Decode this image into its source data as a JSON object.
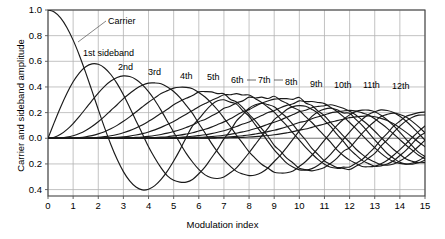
{
  "chart_data": {
    "type": "line",
    "title": "",
    "xlabel": "Modulation index",
    "ylabel": "Carrier and sideband amplitude",
    "xlim": [
      0,
      15
    ],
    "ylim": [
      -0.45,
      1.0
    ],
    "grid": true,
    "legend_position": "inline-annotations",
    "xticks": [
      "0",
      "1",
      "2",
      "3",
      "4",
      "5",
      "6",
      "7",
      "8",
      "9",
      "10",
      "11",
      "12",
      "13",
      "14",
      "15"
    ],
    "xtick_values": [
      0,
      1,
      2,
      3,
      4,
      5,
      6,
      7,
      8,
      9,
      10,
      11,
      12,
      13,
      14,
      15
    ],
    "yticks": [
      "1.0",
      "0.8",
      "0.6",
      "0.4",
      "0.2",
      "0.0",
      "0.2",
      "0.4"
    ],
    "ytick_values": [
      1.0,
      0.8,
      0.6,
      0.4,
      0.2,
      0.0,
      -0.2,
      -0.4
    ],
    "x": [
      0,
      0.25,
      0.5,
      0.75,
      1,
      1.25,
      1.5,
      1.75,
      2,
      2.25,
      2.5,
      2.75,
      3,
      3.25,
      3.5,
      3.75,
      4,
      4.25,
      4.5,
      4.75,
      5,
      5.25,
      5.5,
      5.75,
      6,
      6.25,
      6.5,
      6.75,
      7,
      7.25,
      7.5,
      7.75,
      8,
      8.25,
      8.5,
      8.75,
      9,
      9.25,
      9.5,
      9.75,
      10,
      10.25,
      10.5,
      10.75,
      11,
      11.25,
      11.5,
      11.75,
      12,
      12.25,
      12.5,
      12.75,
      13,
      13.25,
      13.5,
      13.75,
      14,
      14.25,
      14.5,
      14.75,
      15
    ],
    "series": [
      {
        "name": "Carrier",
        "order": 0,
        "label": "Carrier",
        "peak_value": 1.0,
        "first_zero": 2.405,
        "values": [
          1.0,
          0.9844,
          0.9385,
          0.8642,
          0.7652,
          0.6459,
          0.5118,
          0.369,
          0.2239,
          0.0827,
          -0.0484,
          -0.1641,
          -0.2601,
          -0.3325,
          -0.3801,
          -0.4026,
          -0.3971,
          -0.3691,
          -0.3205,
          -0.2561,
          -0.1776,
          -0.0903,
          0.0068,
          0.0963,
          0.1506,
          0.2095,
          0.2601,
          0.2921,
          0.3001,
          0.2818,
          0.2663,
          0.2148,
          0.1717,
          0.1043,
          0.0419,
          -0.0245,
          -0.0903,
          -0.1424,
          -0.1939,
          -0.2243,
          -0.2459,
          -0.2484,
          -0.2366,
          -0.2098,
          -0.1712,
          -0.1229,
          -0.0677,
          -0.0092,
          0.0477,
          0.1025,
          0.1469,
          0.1855,
          0.2069,
          0.2212,
          0.2163,
          0.2012,
          0.1711,
          0.1331,
          0.0875,
          0.0364,
          -0.0142
        ]
      },
      {
        "name": "1st sideband",
        "order": 1,
        "label": "1st sideband",
        "peak_value": 0.582,
        "peak_at": 1.841,
        "values": [
          0,
          0.124,
          0.2423,
          0.3492,
          0.4401,
          0.5106,
          0.5579,
          0.5802,
          0.5767,
          0.5484,
          0.4971,
          0.4258,
          0.3391,
          0.2404,
          0.1374,
          0.0366,
          -0.066,
          -0.1538,
          -0.2311,
          -0.2935,
          -0.3276,
          -0.3414,
          -0.3414,
          -0.321,
          -0.2767,
          -0.2232,
          -0.1538,
          -0.0845,
          -0.0047,
          0.0574,
          0.1352,
          0.184,
          0.2346,
          0.2607,
          0.2731,
          0.2622,
          0.2453,
          0.2031,
          0.1613,
          0.1061,
          0.0435,
          -0.0134,
          -0.0789,
          -0.1275,
          -0.1768,
          -0.2039,
          -0.2284,
          -0.2254,
          -0.2234,
          -0.1951,
          -0.1655,
          -0.1192,
          -0.0703,
          -0.0109,
          0.038,
          0.0946,
          0.1334,
          0.1711,
          0.1864,
          0.2001,
          0.2051
        ]
      },
      {
        "name": "2nd",
        "order": 2,
        "label": "2nd",
        "peak_value": 0.486,
        "peak_at": 3.054,
        "values": [
          0,
          0.0078,
          0.0306,
          0.0673,
          0.1149,
          0.1711,
          0.2321,
          0.294,
          0.3528,
          0.4051,
          0.4461,
          0.4739,
          0.4861,
          0.4813,
          0.4586,
          0.4189,
          0.3641,
          0.2964,
          0.2178,
          0.1331,
          0.0466,
          -0.0374,
          -0.1173,
          -0.185,
          -0.2429,
          -0.2854,
          -0.3074,
          -0.3132,
          -0.3014,
          -0.2694,
          -0.2303,
          -0.1735,
          -0.113,
          -0.0479,
          0.0163,
          0.077,
          0.1448,
          0.1824,
          0.225,
          0.2468,
          0.2546,
          0.2492,
          0.2253,
          0.1933,
          0.139,
          0.0902,
          0.0307,
          -0.0243,
          -0.0849,
          -0.1294,
          -0.1725,
          -0.1977,
          -0.2177,
          -0.2152,
          -0.201,
          -0.1759,
          -0.1345,
          -0.092,
          -0.0396,
          0.0119,
          0.0416
        ]
      },
      {
        "name": "3rd",
        "order": 3,
        "label": "3rd",
        "peak_value": 0.434,
        "peak_at": 4.201,
        "values": [
          0,
          0.0003,
          0.0026,
          0.0086,
          0.0196,
          0.0369,
          0.061,
          0.0921,
          0.1289,
          0.1707,
          0.2166,
          0.2617,
          0.3091,
          0.3492,
          0.3868,
          0.4139,
          0.4302,
          0.4314,
          0.4247,
          0.4002,
          0.3648,
          0.3171,
          0.2561,
          0.1944,
          0.1148,
          0.0416,
          -0.038,
          -0.1072,
          -0.1676,
          -0.2172,
          -0.2581,
          -0.279,
          -0.2911,
          -0.2866,
          -0.2663,
          -0.2314,
          -0.1809,
          -0.1309,
          -0.0701,
          -0.0066,
          0.0583,
          0.116,
          0.1708,
          0.2075,
          0.2273,
          0.2345,
          0.2224,
          0.1977,
          0.1951,
          0.1473,
          0.1013,
          0.044,
          -0.0118,
          -0.0664,
          -0.1186,
          -0.1563,
          -0.1872,
          -0.2011,
          -0.201,
          -0.1905,
          -0.1702
        ]
      },
      {
        "name": "4th",
        "order": 4,
        "label": "4th",
        "peak_value": 0.4,
        "peak_at": 5.318,
        "values": [
          0,
          1e-05,
          0.00016,
          0.0008,
          0.0025,
          0.0059,
          0.0118,
          0.0209,
          0.034,
          0.0513,
          0.0738,
          0.1006,
          0.132,
          0.1671,
          0.2044,
          0.2435,
          0.2811,
          0.3149,
          0.3484,
          0.3713,
          0.3912,
          0.3979,
          0.3967,
          0.3863,
          0.3576,
          0.3217,
          0.2748,
          0.2204,
          0.1578,
          0.0937,
          0.0238,
          -0.0405,
          -0.1054,
          -0.1563,
          -0.2027,
          -0.2325,
          -0.2655,
          -0.2708,
          -0.2689,
          -0.2546,
          -0.2196,
          -0.1809,
          -0.1323,
          -0.0763,
          -0.015,
          0.0434,
          0.1009,
          0.1466,
          0.1825,
          0.2096,
          0.2193,
          0.2192,
          0.2069,
          0.1794,
          0.1428,
          0.0981,
          0.0462,
          -0.008,
          -0.0609,
          -0.1096,
          -0.1422
        ]
      },
      {
        "name": "5th",
        "order": 5,
        "label": "5th",
        "peak_value": 0.374,
        "peak_at": 6.415,
        "values": [
          0,
          0,
          1e-05,
          6e-05,
          0.0002,
          0.0007,
          0.0018,
          0.0039,
          0.007,
          0.0124,
          0.0195,
          0.0296,
          0.043,
          0.0596,
          0.0804,
          0.104,
          0.1321,
          0.1622,
          0.1947,
          0.2255,
          0.2611,
          0.288,
          0.3123,
          0.3327,
          0.3621,
          0.364,
          0.3621,
          0.3479,
          0.3479,
          0.304,
          0.2835,
          0.2395,
          0.1858,
          0.1355,
          0.0757,
          0.0158,
          -0.055,
          -0.1009,
          -0.155,
          -0.1924,
          -0.2341,
          -0.2448,
          -0.2538,
          -0.244,
          -0.227,
          -0.1953,
          -0.1542,
          -0.1018,
          -0.0735,
          -0.0176,
          0.038,
          0.0895,
          0.1316,
          0.1689,
          0.1869,
          0.1957,
          0.1855,
          0.1654,
          0.1298,
          0.0891,
          0.0427
        ]
      },
      {
        "name": "6th",
        "order": 6,
        "label": "6th",
        "peak_value": 0.35,
        "peak_at": 7.501,
        "values": [
          0,
          0,
          0,
          0,
          2e-05,
          7e-05,
          0.0002,
          0.0006,
          0.0012,
          0.0025,
          0.0043,
          0.0073,
          0.0114,
          0.0173,
          0.0254,
          0.0358,
          0.0491,
          0.0655,
          0.0849,
          0.1074,
          0.131,
          0.1594,
          0.1872,
          0.2157,
          0.2458,
          0.2704,
          0.2951,
          0.3155,
          0.3392,
          0.3392,
          0.3479,
          0.3372,
          0.3376,
          0.3089,
          0.2793,
          0.2425,
          0.2043,
          0.15,
          0.0986,
          0.0403,
          -0.0145,
          -0.0717,
          -0.1208,
          -0.1668,
          -0.2016,
          -0.2261,
          -0.2342,
          -0.2345,
          -0.2437,
          -0.218,
          -0.1917,
          -0.1552,
          -0.118,
          -0.0605,
          -0.0118,
          0.0456,
          0.0942,
          0.1357,
          0.1645,
          0.1803,
          0.1813
        ]
      },
      {
        "name": "7th",
        "order": 7,
        "label": "7th",
        "peak_value": 0.33,
        "peak_at": 8.578,
        "values": [
          0,
          0,
          0,
          0,
          0,
          1e-05,
          3e-05,
          8e-05,
          0.0002,
          0.0004,
          0.0008,
          0.0016,
          0.0026,
          0.0043,
          0.0068,
          0.0103,
          0.0152,
          0.0216,
          0.0299,
          0.0401,
          0.0527,
          0.0669,
          0.0843,
          0.103,
          0.1296,
          0.1471,
          0.1732,
          0.1996,
          0.2336,
          0.249,
          0.2759,
          0.2916,
          0.3206,
          0.314,
          0.3206,
          0.31,
          0.3275,
          0.2962,
          0.2724,
          0.2391,
          0.2167,
          0.1687,
          0.1232,
          0.0711,
          0.0184,
          -0.0316,
          -0.0905,
          -0.1343,
          -0.1703,
          -0.1955,
          -0.2196,
          -0.222,
          -0.2177,
          -0.1983,
          -0.171,
          -0.132,
          -0.0889,
          -0.0421,
          0.0072,
          0.0543,
          0.0953
        ]
      },
      {
        "name": "8th",
        "order": 8,
        "label": "8th",
        "peak_value": 0.318,
        "peak_at": 9.647,
        "values": [
          0,
          0,
          0,
          0,
          0,
          0,
          0,
          1e-05,
          2e-05,
          6e-05,
          0.0001,
          0.0003,
          0.0005,
          0.0009,
          0.0016,
          0.0026,
          0.004,
          0.006,
          0.0087,
          0.0123,
          0.0184,
          0.0245,
          0.0333,
          0.0428,
          0.0565,
          0.0698,
          0.0869,
          0.1077,
          0.128,
          0.1514,
          0.1795,
          0.2074,
          0.2235,
          0.2498,
          0.2733,
          0.2907,
          0.3051,
          0.3087,
          0.3086,
          0.3038,
          0.3179,
          0.2754,
          0.2552,
          0.2113,
          0.1757,
          0.1213,
          0.0718,
          0.0189,
          -0.031,
          -0.0834,
          -0.1257,
          -0.1618,
          -0.185,
          -0.2049,
          -0.2088,
          -0.2009,
          -0.1762,
          -0.1471,
          -0.1063,
          -0.0623,
          -0.0142
        ]
      },
      {
        "name": "9th",
        "order": 9,
        "label": "9th",
        "peak_value": 0.306,
        "peak_at": 10.711,
        "values": [
          0,
          0,
          0,
          0,
          0,
          0,
          0,
          0,
          0,
          0,
          2e-05,
          4e-05,
          0.0001,
          0.0002,
          0.0003,
          0.0006,
          0.001,
          0.0016,
          0.0024,
          0.0036,
          0.0055,
          0.0079,
          0.0113,
          0.0154,
          0.0212,
          0.0279,
          0.0367,
          0.047,
          0.0589,
          0.0744,
          0.0915,
          0.1114,
          0.1263,
          0.1538,
          0.1768,
          0.2012,
          0.2149,
          0.2385,
          0.2566,
          0.2686,
          0.2919,
          0.2855,
          0.2863,
          0.2793,
          0.2704,
          0.2408,
          0.2086,
          0.1688,
          0.1231,
          0.0747,
          0.0242,
          -0.0267,
          -0.0739,
          -0.1178,
          -0.1548,
          -0.182,
          -0.1961,
          -0.2012,
          -0.1926,
          -0.1735,
          -0.1428
        ]
      },
      {
        "name": "10th",
        "order": 10,
        "label": "10th",
        "peak_value": 0.297,
        "peak_at": 11.771,
        "values": [
          0,
          0,
          0,
          0,
          0,
          0,
          0,
          0,
          0,
          0,
          0,
          0,
          2e-05,
          3e-05,
          6e-05,
          0.0001,
          0.0002,
          0.0004,
          0.0006,
          0.001,
          0.0015,
          0.0022,
          0.0033,
          0.0048,
          0.007,
          0.0096,
          0.0133,
          0.0177,
          0.0235,
          0.0306,
          0.0396,
          0.0496,
          0.0608,
          0.0757,
          0.0912,
          0.1087,
          0.1247,
          0.1427,
          0.1641,
          0.1847,
          0.2075,
          0.218,
          0.2383,
          0.2482,
          0.2538,
          0.261,
          0.2497,
          0.2348,
          0.2112,
          0.182,
          0.1422,
          0.1018,
          0.0547,
          0.0062,
          -0.0422,
          -0.087,
          -0.1251,
          -0.1611,
          -0.1797,
          -0.1905,
          -0.1899
        ]
      },
      {
        "name": "11th",
        "order": 11,
        "label": "11th",
        "peak_value": 0.288,
        "peak_at": 12.826,
        "values": [
          0,
          0,
          0,
          0,
          0,
          0,
          0,
          0,
          0,
          0,
          0,
          0,
          0,
          0,
          1e-05,
          2e-05,
          4e-05,
          8e-05,
          0.0001,
          0.0002,
          0.0004,
          0.0006,
          0.0009,
          0.0014,
          0.002,
          0.0029,
          0.0042,
          0.0059,
          0.0083,
          0.0113,
          0.0152,
          0.02,
          0.0256,
          0.0333,
          0.042,
          0.0522,
          0.0622,
          0.0754,
          0.0897,
          0.1055,
          0.1231,
          0.1333,
          0.1525,
          0.1679,
          0.1813,
          0.1984,
          0.206,
          0.2128,
          0.2174,
          0.2128,
          0.1977,
          0.1812,
          0.1519,
          0.1157,
          0.0774,
          0.0337,
          -0.0107,
          -0.054,
          -0.0936,
          -0.1323,
          -0.16
        ]
      },
      {
        "name": "12th",
        "order": 12,
        "label": "12th",
        "peak_value": 0.28,
        "peak_at": 13.878,
        "values": [
          0,
          0,
          0,
          0,
          0,
          0,
          0,
          0,
          0,
          0,
          0,
          0,
          0,
          0,
          0,
          0,
          1e-05,
          1e-05,
          3e-05,
          5e-05,
          0.0001,
          0.0002,
          0.0003,
          0.0004,
          0.0006,
          0.0009,
          0.0013,
          0.0019,
          0.0027,
          0.0038,
          0.0053,
          0.0072,
          0.0096,
          0.0128,
          0.0167,
          0.0215,
          0.0274,
          0.0343,
          0.0424,
          0.0516,
          0.0634,
          0.072,
          0.0854,
          0.0982,
          0.111,
          0.1259,
          0.1372,
          0.1488,
          0.1608,
          0.1673,
          0.1709,
          0.1738,
          0.1682,
          0.1551,
          0.1384,
          0.1124,
          0.0812,
          0.0459,
          0.008,
          -0.031,
          -0.0656
        ]
      }
    ]
  },
  "annotations": [
    {
      "name": "carrier-label",
      "text": "Carrier",
      "x": 108,
      "y": 17
    },
    {
      "name": "first-sideband-label",
      "text": "1st sideband",
      "x": 83,
      "y": 49
    },
    {
      "name": "second-label",
      "text": "2nd",
      "x": 118,
      "y": 63
    },
    {
      "name": "third-label",
      "text": "3rd",
      "x": 148,
      "y": 68
    },
    {
      "name": "fourth-label",
      "text": "4th",
      "x": 180,
      "y": 72
    },
    {
      "name": "fifth-label",
      "text": "5th",
      "x": 207,
      "y": 73
    },
    {
      "name": "sixth-label",
      "text": "6th",
      "x": 231,
      "y": 76
    },
    {
      "name": "seventh-label",
      "text": "7th",
      "x": 258,
      "y": 76
    },
    {
      "name": "eighth-label",
      "text": "8th",
      "x": 285,
      "y": 78
    },
    {
      "name": "ninth-label",
      "text": "9th",
      "x": 310,
      "y": 80
    },
    {
      "name": "tenth-label",
      "text": "10th",
      "x": 334,
      "y": 81
    },
    {
      "name": "eleventh-label",
      "text": "11th",
      "x": 363,
      "y": 81
    },
    {
      "name": "twelfth-label",
      "text": "12th",
      "x": 392,
      "y": 82
    }
  ],
  "style": {
    "curve_color": "#1a1a1a",
    "grid_color": "#b4b4b4",
    "axis_color": "#555555",
    "frame_color": "#444444",
    "background": "#ffffff"
  }
}
